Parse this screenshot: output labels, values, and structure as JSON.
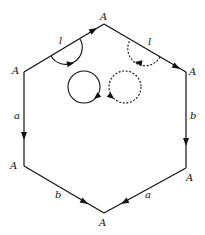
{
  "diagram": {
    "title": "",
    "vertex_label": "A",
    "vertices": [
      {
        "id": "top",
        "label": "A",
        "x": 104,
        "y": 24
      },
      {
        "id": "upper-left",
        "label": "A",
        "x": 24,
        "y": 72
      },
      {
        "id": "upper-right",
        "label": "A",
        "x": 186,
        "y": 72
      },
      {
        "id": "lower-left",
        "label": "A",
        "x": 24,
        "y": 166
      },
      {
        "id": "lower-right",
        "label": "A",
        "x": 186,
        "y": 168
      },
      {
        "id": "bottom",
        "label": "A",
        "x": 104,
        "y": 213
      }
    ],
    "edges": [
      {
        "from": "upper-left",
        "to": "top",
        "label": "l"
      },
      {
        "from": "top",
        "to": "upper-right",
        "label": "l"
      },
      {
        "from": "upper-left",
        "to": "lower-left",
        "label": "a"
      },
      {
        "from": "upper-right",
        "to": "lower-right",
        "label": "b"
      },
      {
        "from": "lower-left",
        "to": "bottom",
        "label": "b"
      },
      {
        "from": "lower-right",
        "to": "bottom",
        "label": "a"
      }
    ],
    "edge_labels": {
      "top_left": "l",
      "top_right": "l",
      "left": "a",
      "right": "b",
      "bottom_left": "b",
      "bottom_right": "a"
    },
    "loops": [
      {
        "style": "solid",
        "kind": "half-circle",
        "position": "under top-left edge"
      },
      {
        "style": "dashed",
        "kind": "half-circle",
        "position": "under top-right edge"
      },
      {
        "style": "solid",
        "kind": "circle",
        "position": "center-left"
      },
      {
        "style": "dashed",
        "kind": "circle",
        "position": "center-right"
      }
    ]
  }
}
